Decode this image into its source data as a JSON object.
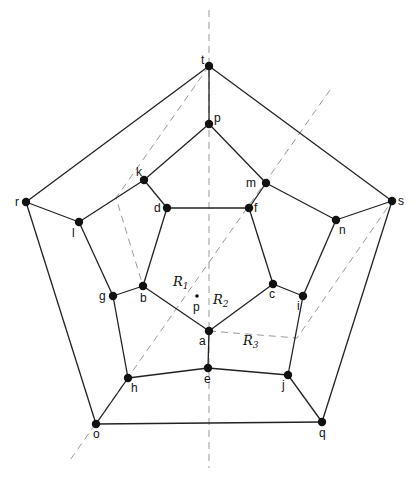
{
  "diagram": {
    "type": "planar graph (dodecahedron) with shortest-path / region decomposition",
    "vertices": [
      {
        "id": "t",
        "x": 209,
        "y": 66,
        "lx": -8,
        "ly": -2
      },
      {
        "id": "p",
        "x": 209,
        "y": 124,
        "lx": 5,
        "ly": -2
      },
      {
        "id": "k",
        "x": 144,
        "y": 180,
        "lx": -8,
        "ly": -4
      },
      {
        "id": "m",
        "x": 266,
        "y": 183,
        "lx": -20,
        "ly": 4
      },
      {
        "id": "d",
        "x": 167,
        "y": 208,
        "lx": -13,
        "ly": 4
      },
      {
        "id": "f",
        "x": 249,
        "y": 208,
        "lx": 5,
        "ly": 4
      },
      {
        "id": "r",
        "x": 26,
        "y": 202,
        "lx": -11,
        "ly": 4
      },
      {
        "id": "l",
        "x": 79,
        "y": 222,
        "lx": -7,
        "ly": 15
      },
      {
        "id": "s",
        "x": 392,
        "y": 201,
        "lx": 6,
        "ly": 4
      },
      {
        "id": "n",
        "x": 336,
        "y": 220,
        "lx": 3,
        "ly": 14
      },
      {
        "id": "g",
        "x": 113,
        "y": 296,
        "lx": -14,
        "ly": 4
      },
      {
        "id": "b",
        "x": 143,
        "y": 286,
        "lx": -3,
        "ly": 16
      },
      {
        "id": "c",
        "x": 273,
        "y": 284,
        "lx": -4,
        "ly": 14
      },
      {
        "id": "i",
        "x": 303,
        "y": 296,
        "lx": -6,
        "ly": 14
      },
      {
        "id": "a",
        "x": 209,
        "y": 331,
        "lx": -10,
        "ly": 14
      },
      {
        "id": "e",
        "x": 208,
        "y": 368,
        "lx": -4,
        "ly": 15
      },
      {
        "id": "h",
        "x": 128,
        "y": 378,
        "lx": 3,
        "ly": 14
      },
      {
        "id": "j",
        "x": 288,
        "y": 375,
        "lx": -6,
        "ly": 14
      },
      {
        "id": "o",
        "x": 96,
        "y": 424,
        "lx": -3,
        "ly": 14
      },
      {
        "id": "q",
        "x": 322,
        "y": 422,
        "lx": -3,
        "ly": 15
      }
    ],
    "edges": [
      [
        "t",
        "r"
      ],
      [
        "t",
        "s"
      ],
      [
        "t",
        "p"
      ],
      [
        "p",
        "k"
      ],
      [
        "p",
        "m"
      ],
      [
        "k",
        "d"
      ],
      [
        "k",
        "l"
      ],
      [
        "m",
        "f"
      ],
      [
        "m",
        "n"
      ],
      [
        "d",
        "f"
      ],
      [
        "d",
        "b"
      ],
      [
        "f",
        "c"
      ],
      [
        "r",
        "l"
      ],
      [
        "r",
        "o"
      ],
      [
        "s",
        "n"
      ],
      [
        "s",
        "q"
      ],
      [
        "l",
        "g"
      ],
      [
        "n",
        "i"
      ],
      [
        "g",
        "b"
      ],
      [
        "g",
        "h"
      ],
      [
        "c",
        "i"
      ],
      [
        "i",
        "j"
      ],
      [
        "b",
        "a"
      ],
      [
        "c",
        "a"
      ],
      [
        "a",
        "e"
      ],
      [
        "h",
        "e"
      ],
      [
        "e",
        "j"
      ],
      [
        "h",
        "o"
      ],
      [
        "j",
        "q"
      ],
      [
        "o",
        "q"
      ]
    ],
    "dashed_lines": [
      {
        "name": "vertical-axis",
        "points": [
          [
            209,
            10
          ],
          [
            209,
            468
          ]
        ]
      },
      {
        "name": "long-diagonal",
        "points": [
          [
            330,
            90
          ],
          [
            68,
            463
          ]
        ]
      },
      {
        "name": "t-to-b-bent",
        "points": [
          [
            209,
            66
          ],
          [
            116,
            198
          ],
          [
            143,
            286
          ]
        ]
      },
      {
        "name": "a-to-s-bent",
        "points": [
          [
            209,
            331
          ],
          [
            297,
            338
          ],
          [
            392,
            201
          ]
        ]
      }
    ],
    "query_point": {
      "label": "p",
      "x": 197,
      "y": 296,
      "lx": -4,
      "ly": 15
    },
    "regions": [
      {
        "label": "R",
        "sub": "1",
        "x": 173,
        "y": 286
      },
      {
        "label": "R",
        "sub": "2",
        "x": 213,
        "y": 304
      },
      {
        "label": "R",
        "sub": "3",
        "x": 243,
        "y": 345
      }
    ],
    "colors": {
      "edge": "#222222",
      "dash": "#9a9a9a",
      "vertex": "#111111",
      "background": "#ffffff"
    }
  }
}
